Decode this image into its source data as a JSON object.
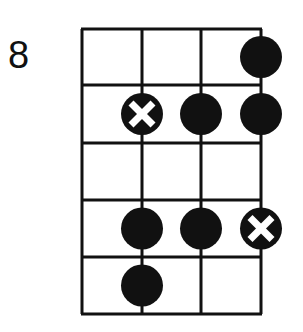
{
  "diagram": {
    "fret_label": "8",
    "strings": 4,
    "frets": 5,
    "notes": [
      {
        "fret": 1,
        "string": 4,
        "type": "dot"
      },
      {
        "fret": 2,
        "string": 2,
        "type": "root"
      },
      {
        "fret": 2,
        "string": 3,
        "type": "dot"
      },
      {
        "fret": 2,
        "string": 4,
        "type": "dot"
      },
      {
        "fret": 4,
        "string": 2,
        "type": "dot"
      },
      {
        "fret": 4,
        "string": 3,
        "type": "dot"
      },
      {
        "fret": 4,
        "string": 4,
        "type": "root"
      },
      {
        "fret": 5,
        "string": 2,
        "type": "dot"
      }
    ],
    "colors": {
      "line": "#111111",
      "dot": "#111111",
      "marker": "#ffffff"
    }
  }
}
